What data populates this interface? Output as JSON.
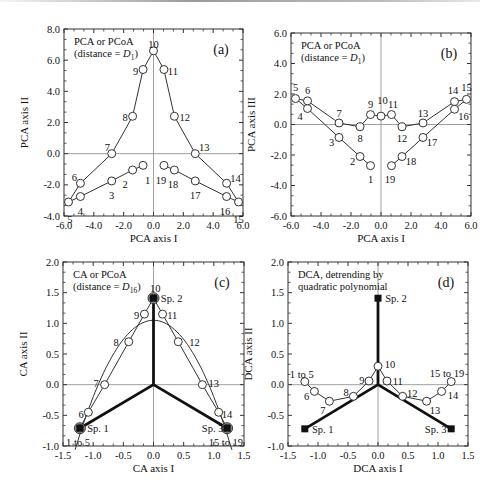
{
  "chart_data": [
    {
      "id": "a",
      "type": "scatter",
      "panel_label": "(a)",
      "title_lines": [
        "PCA or PCoA",
        "(distance = D1)"
      ],
      "xlabel": "PCA axis I",
      "ylabel": "PCA axis II",
      "xlim": [
        -6,
        6
      ],
      "ylim": [
        -4,
        8
      ],
      "xticks": [
        "-6.0",
        "-4.0",
        "-2.0",
        "0.0",
        "2.0",
        "4.0",
        "6.0"
      ],
      "yticks": [
        "-4.0",
        "-2.0",
        "0.0",
        "2.0",
        "4.0",
        "6.0",
        "8.0"
      ],
      "frame": {
        "x0": 64,
        "x1": 243,
        "y0": 29,
        "y1": 216
      },
      "points": [
        {
          "label": "1",
          "x": -0.7,
          "y": -0.75,
          "lx": -0.4,
          "ly": -1.7
        },
        {
          "label": "2",
          "x": -1.4,
          "y": -1.05,
          "lx": -1.9,
          "ly": -1.95
        },
        {
          "label": "3",
          "x": -2.8,
          "y": -1.75,
          "lx": -2.8,
          "ly": -2.7
        },
        {
          "label": "4",
          "x": -4.9,
          "y": -2.75,
          "lx": -4.9,
          "ly": -3.7
        },
        {
          "label": "5",
          "x": -5.7,
          "y": -3.1,
          "lx": -5.6,
          "ly": -4.2
        },
        {
          "label": "6",
          "x": -4.9,
          "y": -1.9,
          "lx": -5.3,
          "ly": -1.5
        },
        {
          "label": "7",
          "x": -2.8,
          "y": 0.0,
          "lx": -3.1,
          "ly": 0.4
        },
        {
          "label": "8",
          "x": -1.4,
          "y": 2.4,
          "lx": -1.9,
          "ly": 2.3
        },
        {
          "label": "9",
          "x": -0.7,
          "y": 5.4,
          "lx": -1.2,
          "ly": 5.3
        },
        {
          "label": "10",
          "x": 0.0,
          "y": 6.6,
          "lx": 0.0,
          "ly": 7.0
        },
        {
          "label": "11",
          "x": 0.7,
          "y": 5.4,
          "lx": 1.3,
          "ly": 5.3
        },
        {
          "label": "12",
          "x": 1.4,
          "y": 2.4,
          "lx": 2.1,
          "ly": 2.3
        },
        {
          "label": "13",
          "x": 2.8,
          "y": 0.0,
          "lx": 3.4,
          "ly": 0.4
        },
        {
          "label": "14",
          "x": 4.9,
          "y": -1.9,
          "lx": 5.5,
          "ly": -1.6
        },
        {
          "label": "15",
          "x": 5.7,
          "y": -3.1,
          "lx": 5.7,
          "ly": -4.2
        },
        {
          "label": "16",
          "x": 4.9,
          "y": -2.75,
          "lx": 4.8,
          "ly": -3.7
        },
        {
          "label": "17",
          "x": 2.8,
          "y": -1.75,
          "lx": 2.8,
          "ly": -2.7
        },
        {
          "label": "18",
          "x": 1.4,
          "y": -1.05,
          "lx": 1.3,
          "ly": -1.95
        },
        {
          "label": "19",
          "x": 0.7,
          "y": -0.75,
          "lx": 0.5,
          "ly": -1.75
        }
      ],
      "lines": [
        [
          "5",
          "6",
          "7",
          "8",
          "9",
          "10",
          "11",
          "12",
          "13",
          "14",
          "15"
        ],
        [
          "5",
          "4",
          "3",
          "2",
          "1"
        ],
        [
          "19",
          "18",
          "17",
          "16",
          "15"
        ]
      ],
      "species": [],
      "arcs": []
    },
    {
      "id": "b",
      "type": "scatter",
      "panel_label": "(b)",
      "title_lines": [
        "PCA or PCoA",
        "(distance = D1)"
      ],
      "xlabel": "PCA axis I",
      "ylabel": "PCA axis III",
      "xlim": [
        -6,
        6
      ],
      "ylim": [
        -6,
        6
      ],
      "xticks": [
        "-6.0",
        "-4.0",
        "-2.0",
        "0.0",
        "2.0",
        "4.0",
        "6.0"
      ],
      "yticks": [
        "-6.0",
        "-4.0",
        "-2.0",
        "0.0",
        "2.0",
        "4.0",
        "6.0"
      ],
      "frame": {
        "x0": 291,
        "x1": 471,
        "y0": 33,
        "y1": 216
      },
      "points": [
        {
          "label": "1",
          "x": -0.7,
          "y": -2.7,
          "lx": -0.7,
          "ly": -3.6
        },
        {
          "label": "2",
          "x": -1.4,
          "y": -2.1,
          "lx": -1.9,
          "ly": -2.4
        },
        {
          "label": "3",
          "x": -2.8,
          "y": -0.85,
          "lx": -3.3,
          "ly": -1.2
        },
        {
          "label": "4",
          "x": -4.9,
          "y": 1.05,
          "lx": -5.4,
          "ly": 0.5
        },
        {
          "label": "5",
          "x": -5.7,
          "y": 1.7,
          "lx": -5.7,
          "ly": 2.4
        },
        {
          "label": "6",
          "x": -4.9,
          "y": 1.55,
          "lx": -4.9,
          "ly": 2.2
        },
        {
          "label": "7",
          "x": -2.8,
          "y": 0.1,
          "lx": -2.8,
          "ly": 0.7
        },
        {
          "label": "8",
          "x": -1.4,
          "y": -0.15,
          "lx": -1.4,
          "ly": -0.9
        },
        {
          "label": "9",
          "x": -0.7,
          "y": 0.65,
          "lx": -0.7,
          "ly": 1.3
        },
        {
          "label": "10",
          "x": 0.0,
          "y": 0.55,
          "lx": 0.1,
          "ly": 1.6
        },
        {
          "label": "11",
          "x": 0.7,
          "y": 0.65,
          "lx": 0.8,
          "ly": 1.3
        },
        {
          "label": "12",
          "x": 1.4,
          "y": -0.15,
          "lx": 1.4,
          "ly": -0.9
        },
        {
          "label": "13",
          "x": 2.8,
          "y": 0.1,
          "lx": 2.8,
          "ly": 0.7
        },
        {
          "label": "14",
          "x": 4.9,
          "y": 1.5,
          "lx": 4.8,
          "ly": 2.2
        },
        {
          "label": "15",
          "x": 5.7,
          "y": 1.65,
          "lx": 5.7,
          "ly": 2.4
        },
        {
          "label": "16",
          "x": 4.9,
          "y": 1.0,
          "lx": 5.5,
          "ly": 0.5
        },
        {
          "label": "17",
          "x": 2.8,
          "y": -0.85,
          "lx": 3.4,
          "ly": -1.2
        },
        {
          "label": "18",
          "x": 1.4,
          "y": -2.1,
          "lx": 2.0,
          "ly": -2.4
        },
        {
          "label": "19",
          "x": 0.7,
          "y": -2.7,
          "lx": 0.6,
          "ly": -3.6
        }
      ],
      "lines": [
        [
          "5",
          "6",
          "7",
          "8",
          "9",
          "10",
          "11",
          "12",
          "13",
          "14",
          "15"
        ],
        [
          "5",
          "4",
          "3",
          "2",
          "1"
        ],
        [
          "19",
          "18",
          "17",
          "16",
          "15"
        ]
      ],
      "species": [],
      "arcs": []
    },
    {
      "id": "c",
      "type": "scatter",
      "panel_label": "(c)",
      "title_lines": [
        "CA or PCoA",
        "(distance = D16)"
      ],
      "xlabel": "CA axis I",
      "ylabel": "CA axis II",
      "xlim": [
        -1.5,
        1.5
      ],
      "ylim": [
        -1.0,
        2.0
      ],
      "xticks": [
        "-1.5",
        "-1.0",
        "-0.5",
        "0.0",
        "0.5",
        "1.0",
        "1.5"
      ],
      "yticks": [
        "-1.0",
        "-0.5",
        "0.0",
        "0.5",
        "1.0",
        "1.5",
        "2.0"
      ],
      "frame": {
        "x0": 63,
        "x1": 244,
        "y0": 262,
        "y1": 446
      },
      "points": [
        {
          "label": "1 to 5",
          "x": -1.22,
          "y": -0.71,
          "lx": -1.25,
          "ly": -0.95
        },
        {
          "label": "6",
          "x": -1.08,
          "y": -0.45,
          "lx": -1.2,
          "ly": -0.48
        },
        {
          "label": "7",
          "x": -0.81,
          "y": 0.0,
          "lx": -0.95,
          "ly": 0.02
        },
        {
          "label": "8",
          "x": -0.41,
          "y": 0.7,
          "lx": -0.62,
          "ly": 0.68
        },
        {
          "label": "9",
          "x": -0.15,
          "y": 1.15,
          "lx": -0.28,
          "ly": 1.13
        },
        {
          "label": "10",
          "x": 0.0,
          "y": 1.41,
          "lx": 0.03,
          "ly": 1.56
        },
        {
          "label": "11",
          "x": 0.15,
          "y": 1.15,
          "lx": 0.31,
          "ly": 1.13
        },
        {
          "label": "12",
          "x": 0.41,
          "y": 0.7,
          "lx": 0.68,
          "ly": 0.68
        },
        {
          "label": "13",
          "x": 0.81,
          "y": 0.0,
          "lx": 1.0,
          "ly": 0.02
        },
        {
          "label": "14",
          "x": 1.08,
          "y": -0.45,
          "lx": 1.22,
          "ly": -0.48
        },
        {
          "label": "15 to 19",
          "x": 1.22,
          "y": -0.71,
          "lx": 1.2,
          "ly": -0.95
        }
      ],
      "lines": [
        [
          "1 to 5",
          "6",
          "7",
          "8",
          "9",
          "10",
          "11",
          "12",
          "13",
          "14",
          "15 to 19"
        ]
      ],
      "species": [
        {
          "label": "Sp. 1",
          "x": -1.22,
          "y": -0.71,
          "lx": -0.92,
          "ly": -0.72
        },
        {
          "label": "Sp. 2",
          "x": 0.0,
          "y": 1.41,
          "lx": 0.3,
          "ly": 1.41
        },
        {
          "label": "Sp. 3",
          "x": 1.22,
          "y": -0.71,
          "lx": 0.98,
          "ly": -0.72
        }
      ],
      "arcs": [
        {
          "type": "parabola",
          "x0": -1.3,
          "x1": 1.3,
          "a": -1.25,
          "c": 1.05
        }
      ]
    },
    {
      "id": "d",
      "type": "scatter",
      "panel_label": "(d)",
      "title_lines": [
        "DCA, detrending by",
        "quadratic polynomial"
      ],
      "xlabel": "DCA axis I",
      "ylabel": "DCA axis II",
      "xlim": [
        -1.5,
        1.5
      ],
      "ylim": [
        -1.0,
        2.0
      ],
      "xticks": [
        "-1.5",
        "-1.0",
        "-0.5",
        "0.0",
        "0.5",
        "1.0",
        "1.5"
      ],
      "yticks": [
        "-1.0",
        "-0.5",
        "0.0",
        "0.5",
        "1.0",
        "1.5",
        "2.0"
      ],
      "frame": {
        "x0": 288,
        "x1": 468,
        "y0": 262,
        "y1": 446
      },
      "points": [
        {
          "label": "1 to 5",
          "x": -1.22,
          "y": 0.05,
          "lx": -1.27,
          "ly": 0.17
        },
        {
          "label": "6",
          "x": -1.06,
          "y": -0.11,
          "lx": -1.19,
          "ly": -0.2
        },
        {
          "label": "7",
          "x": -0.81,
          "y": -0.27,
          "lx": -0.92,
          "ly": -0.42
        },
        {
          "label": "8",
          "x": -0.41,
          "y": -0.19,
          "lx": -0.53,
          "ly": -0.13
        },
        {
          "label": "9",
          "x": -0.15,
          "y": 0.06,
          "lx": -0.27,
          "ly": 0.07
        },
        {
          "label": "10",
          "x": 0.0,
          "y": 0.3,
          "lx": 0.2,
          "ly": 0.33
        },
        {
          "label": "11",
          "x": 0.15,
          "y": 0.06,
          "lx": 0.33,
          "ly": 0.05
        },
        {
          "label": "12",
          "x": 0.41,
          "y": -0.19,
          "lx": 0.57,
          "ly": -0.14
        },
        {
          "label": "13",
          "x": 0.81,
          "y": -0.27,
          "lx": 0.95,
          "ly": -0.42
        },
        {
          "label": "14",
          "x": 1.06,
          "y": -0.11,
          "lx": 1.25,
          "ly": -0.17
        },
        {
          "label": "15 to 19",
          "x": 1.22,
          "y": 0.05,
          "lx": 1.15,
          "ly": 0.18
        }
      ],
      "lines": [
        [
          "1 to 5",
          "6",
          "7",
          "8",
          "9",
          "10",
          "11",
          "12",
          "13",
          "14",
          "15 to 19"
        ]
      ],
      "species": [
        {
          "label": "Sp. 1",
          "x": -1.22,
          "y": -0.72,
          "lx": -0.92,
          "ly": -0.73
        },
        {
          "label": "Sp. 2",
          "x": 0.0,
          "y": 1.41,
          "lx": 0.3,
          "ly": 1.41
        },
        {
          "label": "Sp. 3",
          "x": 1.22,
          "y": -0.72,
          "lx": 0.96,
          "ly": -0.73
        }
      ],
      "arcs": []
    }
  ]
}
